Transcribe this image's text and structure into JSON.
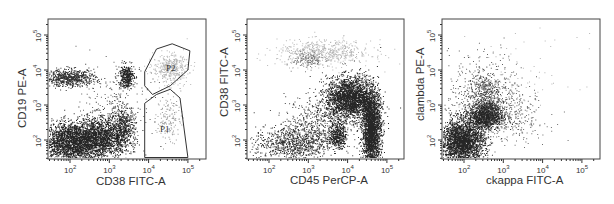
{
  "chart_data": [
    {
      "type": "scatter",
      "title": "",
      "xlabel": "CD38 FITC-A",
      "ylabel": "CD19 PE-A",
      "xscale": "log",
      "yscale": "log",
      "xlim": [
        30,
        150000
      ],
      "ylim": [
        30,
        250000
      ],
      "x_ticks": [
        "10^2",
        "10^3",
        "10^4",
        "10^5"
      ],
      "y_ticks": [
        "10^2",
        "10^3",
        "10^4",
        "10^5"
      ],
      "grid": false,
      "legend": null,
      "gates": [
        {
          "name": "P2",
          "vertices_log": [
            [
              3.9,
              3.95
            ],
            [
              4.2,
              4.6
            ],
            [
              4.6,
              4.75
            ],
            [
              5.05,
              4.55
            ],
            [
              5.0,
              4.0
            ],
            [
              4.55,
              3.55
            ],
            [
              4.1,
              3.3
            ],
            [
              3.9,
              3.55
            ]
          ]
        },
        {
          "name": "P1",
          "vertices_log": [
            [
              3.9,
              1.5
            ],
            [
              3.9,
              3.05
            ],
            [
              4.2,
              3.3
            ],
            [
              4.55,
              3.45
            ],
            [
              4.8,
              3.2
            ],
            [
              5.0,
              1.5
            ]
          ]
        }
      ],
      "clusters": [
        {
          "cx_log": 2.05,
          "cy_log": 1.95,
          "sx": 0.45,
          "sy": 0.28,
          "n": 2600,
          "shade": "#000"
        },
        {
          "cx_log": 2.8,
          "cy_log": 2.1,
          "sx": 0.35,
          "sy": 0.3,
          "n": 1400,
          "shade": "#000"
        },
        {
          "cx_log": 3.35,
          "cy_log": 2.4,
          "sx": 0.15,
          "sy": 0.3,
          "n": 500,
          "shade": "#111"
        },
        {
          "cx_log": 2.0,
          "cy_log": 3.78,
          "sx": 0.32,
          "sy": 0.12,
          "n": 700,
          "shade": "#111"
        },
        {
          "cx_log": 3.42,
          "cy_log": 3.82,
          "sx": 0.1,
          "sy": 0.17,
          "n": 380,
          "shade": "#000"
        },
        {
          "cx_log": 3.2,
          "cy_log": 3.1,
          "sx": 0.45,
          "sy": 0.5,
          "n": 160,
          "shade": "#444"
        },
        {
          "cx_log": 4.55,
          "cy_log": 4.05,
          "sx": 0.22,
          "sy": 0.2,
          "n": 420,
          "shade": "#999"
        },
        {
          "cx_log": 4.5,
          "cy_log": 2.65,
          "sx": 0.15,
          "sy": 0.35,
          "n": 150,
          "shade": "#888"
        }
      ]
    },
    {
      "type": "scatter",
      "title": "",
      "xlabel": "CD45 PerCP-A",
      "ylabel": "CD38 FITC-A",
      "xscale": "log",
      "yscale": "log",
      "xlim": [
        30,
        150000
      ],
      "ylim": [
        30,
        250000
      ],
      "x_ticks": [
        "10^2",
        "10^3",
        "10^4",
        "10^5"
      ],
      "y_ticks": [
        "10^2",
        "10^3",
        "10^4",
        "10^5"
      ],
      "grid": false,
      "legend": null,
      "clusters": [
        {
          "cx_log": 4.05,
          "cy_log": 3.2,
          "sx": 0.3,
          "sy": 0.3,
          "n": 2400,
          "shade": "#000"
        },
        {
          "cx_log": 4.6,
          "cy_log": 2.3,
          "sx": 0.12,
          "sy": 0.55,
          "n": 2600,
          "shade": "#000"
        },
        {
          "cx_log": 3.75,
          "cy_log": 2.15,
          "sx": 0.1,
          "sy": 0.18,
          "n": 400,
          "shade": "#000"
        },
        {
          "cx_log": 2.6,
          "cy_log": 1.9,
          "sx": 0.5,
          "sy": 0.25,
          "n": 900,
          "shade": "#111"
        },
        {
          "cx_log": 3.2,
          "cy_log": 2.5,
          "sx": 0.4,
          "sy": 0.4,
          "n": 500,
          "shade": "#222"
        },
        {
          "cx_log": 3.4,
          "cy_log": 4.5,
          "sx": 0.6,
          "sy": 0.18,
          "n": 600,
          "shade": "#999"
        },
        {
          "cx_log": 3.0,
          "cy_log": 4.3,
          "sx": 0.2,
          "sy": 0.12,
          "n": 150,
          "shade": "#666"
        }
      ]
    },
    {
      "type": "scatter",
      "title": "",
      "xlabel": "ckappa FITC-A",
      "ylabel": "clambda PE-A",
      "xscale": "log",
      "yscale": "log",
      "xlim": [
        30,
        150000
      ],
      "ylim": [
        30,
        250000
      ],
      "x_ticks": [
        "10^2",
        "10^3",
        "10^4",
        "10^5"
      ],
      "y_ticks": [
        "10^2",
        "10^3",
        "10^4",
        "10^5"
      ],
      "grid": false,
      "legend": null,
      "clusters": [
        {
          "cx_log": 1.95,
          "cy_log": 1.95,
          "sx": 0.28,
          "sy": 0.32,
          "n": 2600,
          "shade": "#000"
        },
        {
          "cx_log": 2.55,
          "cy_log": 2.7,
          "sx": 0.22,
          "sy": 0.18,
          "n": 1200,
          "shade": "#000"
        },
        {
          "cx_log": 2.5,
          "cy_log": 3.3,
          "sx": 0.2,
          "sy": 0.3,
          "n": 350,
          "shade": "#222"
        },
        {
          "cx_log": 2.6,
          "cy_log": 3.3,
          "sx": 0.5,
          "sy": 0.6,
          "n": 500,
          "shade": "#444"
        },
        {
          "cx_log": 3.2,
          "cy_log": 2.6,
          "sx": 0.45,
          "sy": 0.35,
          "n": 250,
          "shade": "#555"
        },
        {
          "cx_log": 3.3,
          "cy_log": 3.8,
          "sx": 0.8,
          "sy": 0.6,
          "n": 80,
          "shade": "#999"
        }
      ]
    }
  ],
  "panels": [
    {
      "xlabel": "CD38 FITC-A",
      "ylabel": "CD19 PE-A",
      "gate_labels": [
        "P2",
        "P1"
      ]
    },
    {
      "xlabel": "CD45 PerCP-A",
      "ylabel": "CD38 FITC-A"
    },
    {
      "xlabel": "ckappa FITC-A",
      "ylabel": "clambda PE-A"
    }
  ],
  "tick_labels": {
    "base": "10",
    "exps": [
      "2",
      "3",
      "4",
      "5"
    ]
  }
}
